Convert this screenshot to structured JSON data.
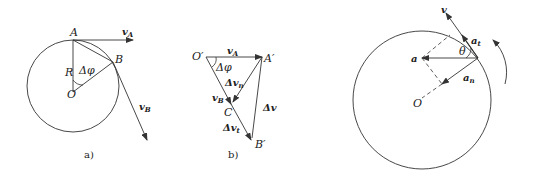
{
  "figure_a": {
    "caption": "a)",
    "labels": {
      "A": "A",
      "B": "B",
      "O": "O",
      "R": "R",
      "delta_phi": "Δφ",
      "vA": "v",
      "vA_sub": "A",
      "vB": "v",
      "vB_sub": "B"
    }
  },
  "figure_b": {
    "caption": "b)",
    "labels": {
      "O_prime": "O′",
      "A_prime": "A′",
      "B_prime": "B′",
      "C": "C",
      "delta_phi": "Δφ",
      "vA": "v",
      "vA_sub": "A",
      "vB": "v",
      "vB_sub": "B",
      "dvn": "Δv",
      "dvn_sub": "n",
      "dvt": "Δv",
      "dvt_sub": "t",
      "dv": "Δv"
    }
  },
  "figure_c": {
    "labels": {
      "v": "v",
      "a": "a",
      "O": "O",
      "theta": "θ",
      "at": "a",
      "at_sub": "t",
      "an": "a",
      "an_sub": "n"
    }
  },
  "colors": {
    "stroke": "#333333",
    "background": "#ffffff"
  }
}
